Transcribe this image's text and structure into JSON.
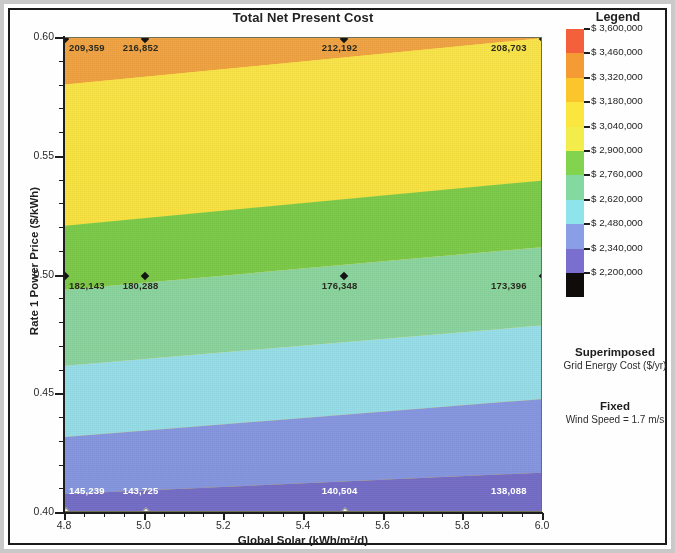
{
  "chart_data": {
    "type": "heatmap",
    "title": "Total Net Present Cost",
    "xlabel": "Global Solar (kWh/m²/d)",
    "ylabel": "Rate 1 Power Price ($/kWh)",
    "xlim": [
      4.8,
      6.0
    ],
    "ylim": [
      0.4,
      0.6
    ],
    "x_ticks": [
      "4.8",
      "5.0",
      "5.2",
      "5.4",
      "5.6",
      "5.8",
      "6.0"
    ],
    "x_tick_values": [
      4.8,
      5.0,
      5.2,
      5.4,
      5.6,
      5.8,
      6.0
    ],
    "y_ticks": [
      "0.40",
      "0.45",
      "0.50",
      "0.55",
      "0.60"
    ],
    "y_tick_values": [
      0.4,
      0.45,
      0.5,
      0.55,
      0.6
    ],
    "grid": false,
    "colorbar_title": "Legend",
    "colorbar_unit": "$",
    "colorbar_levels": [
      "$ 3,600,000",
      "$ 3,460,000",
      "$ 3,320,000",
      "$ 3,180,000",
      "$ 3,040,000",
      "$ 2,900,000",
      "$ 2,760,000",
      "$ 2,620,000",
      "$ 2,480,000",
      "$ 2,340,000",
      "$ 2,200,000"
    ],
    "colorbar_values": [
      3600000,
      3460000,
      3320000,
      3180000,
      3040000,
      2900000,
      2760000,
      2620000,
      2480000,
      2340000,
      2200000
    ],
    "colorbar_colors": [
      "#f4603c",
      "#f59b34",
      "#fbc52c",
      "#fbe63f",
      "#f2ed4b",
      "#82d34e",
      "#84d9a0",
      "#8fe3ea",
      "#8a9ee6",
      "#7a6fce",
      "#100c0c"
    ],
    "superimposed_label": "Superimposed",
    "superimposed_variable": "Grid Energy Cost ($/yr)",
    "fixed_label": "Fixed",
    "fixed_variable": "Wind Speed = 1.7 m/s",
    "superimposed_points": [
      {
        "x": 4.8,
        "y": 0.6,
        "label": "209,359",
        "text_color": "dark"
      },
      {
        "x": 5.0,
        "y": 0.6,
        "label": "216,852",
        "text_color": "dark"
      },
      {
        "x": 5.5,
        "y": 0.6,
        "label": "212,192",
        "text_color": "dark"
      },
      {
        "x": 6.0,
        "y": 0.6,
        "label": "208,703",
        "text_color": "dark"
      },
      {
        "x": 4.8,
        "y": 0.5,
        "label": "182,143",
        "text_color": "dark"
      },
      {
        "x": 5.0,
        "y": 0.5,
        "label": "180,288",
        "text_color": "dark"
      },
      {
        "x": 5.5,
        "y": 0.5,
        "label": "176,348",
        "text_color": "dark"
      },
      {
        "x": 6.0,
        "y": 0.5,
        "label": "173,396",
        "text_color": "dark"
      },
      {
        "x": 4.8,
        "y": 0.4,
        "label": "145,239",
        "text_color": "light"
      },
      {
        "x": 5.0,
        "y": 0.4,
        "label": "143,725",
        "text_color": "light"
      },
      {
        "x": 5.5,
        "y": 0.4,
        "label": "140,504",
        "text_color": "light"
      },
      {
        "x": 6.0,
        "y": 0.4,
        "label": "138,088",
        "text_color": "light"
      }
    ],
    "bands": [
      {
        "color": "#f2a03a",
        "left_top_frac": 0.0,
        "left_bottom_frac": 0.098,
        "right_top_frac": 0.0,
        "right_bottom_frac": 0.0,
        "note": "orange band upper-left wedge"
      },
      {
        "color": "#fbe541",
        "left_top_frac": 0.098,
        "left_bottom_frac": 0.395,
        "right_top_frac": 0.0,
        "right_bottom_frac": 0.3,
        "note": "yellow"
      },
      {
        "color": "#7ece4a",
        "left_top_frac": 0.395,
        "left_bottom_frac": 0.53,
        "right_top_frac": 0.3,
        "right_bottom_frac": 0.44,
        "note": "green"
      },
      {
        "color": "#8ed9a1",
        "left_top_frac": 0.53,
        "left_bottom_frac": 0.69,
        "right_top_frac": 0.44,
        "right_bottom_frac": 0.605,
        "note": "mint green"
      },
      {
        "color": "#9ae4ef",
        "left_top_frac": 0.69,
        "left_bottom_frac": 0.84,
        "right_top_frac": 0.605,
        "right_bottom_frac": 0.76,
        "note": "cyan"
      },
      {
        "color": "#8b9ce8",
        "left_top_frac": 0.84,
        "left_bottom_frac": 0.96,
        "right_top_frac": 0.76,
        "right_bottom_frac": 0.915,
        "note": "periwinkle"
      },
      {
        "color": "#7a72cf",
        "left_top_frac": 0.96,
        "left_bottom_frac": 1.0,
        "right_top_frac": 0.915,
        "right_bottom_frac": 1.0,
        "note": "violet"
      }
    ]
  }
}
